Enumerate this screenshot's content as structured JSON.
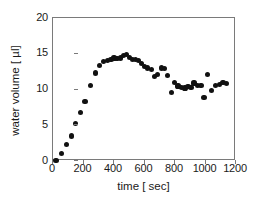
{
  "chart_data": {
    "type": "scatter",
    "title": "",
    "xlabel": "time [ sec]",
    "ylabel": "water volume [ µl]",
    "xlim": [
      0,
      1200
    ],
    "ylim": [
      0,
      20
    ],
    "xticks": [
      0,
      200,
      400,
      600,
      800,
      1000,
      1200
    ],
    "yticks": [
      0,
      5,
      10,
      15,
      20
    ],
    "grid": false,
    "legend": null,
    "marker": "filled-circle",
    "marker_color": "#111111",
    "frame_color": "#7a7a7a",
    "series": [
      {
        "name": "water volume",
        "x": [
          20,
          55,
          90,
          120,
          150,
          180,
          210,
          245,
          280,
          305,
          330,
          355,
          380,
          400,
          420,
          440,
          460,
          480,
          500,
          520,
          540,
          560,
          580,
          600,
          620,
          645,
          665,
          685,
          710,
          730,
          750,
          775,
          795,
          820,
          845,
          865,
          885,
          905,
          925,
          950,
          970,
          990,
          1015,
          1040,
          1065,
          1090,
          1115,
          1140
        ],
        "y": [
          0.1,
          1.0,
          2.3,
          3.5,
          5.3,
          6.8,
          8.3,
          10.6,
          12.3,
          13.4,
          13.9,
          14.0,
          14.2,
          14.4,
          14.3,
          14.4,
          14.7,
          14.9,
          14.5,
          14.2,
          14.2,
          14.0,
          13.6,
          13.2,
          13.0,
          12.8,
          11.8,
          12.1,
          13.0,
          12.9,
          12.0,
          9.6,
          11.0,
          10.5,
          10.3,
          10.2,
          10.4,
          10.3,
          10.9,
          10.6,
          10.6,
          8.9,
          12.1,
          9.9,
          10.6,
          10.7,
          11.0,
          10.8
        ]
      }
    ]
  }
}
